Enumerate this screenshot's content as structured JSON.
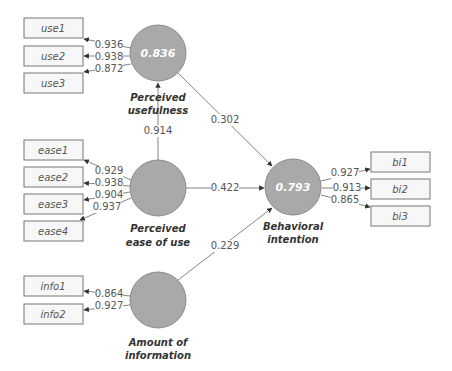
{
  "diagram": {
    "type": "structural-equation-model",
    "constructs": [
      {
        "id": "pu",
        "label_line1": "Perceived",
        "label_line2": "usefulness",
        "r2": "0.836"
      },
      {
        "id": "peou",
        "label_line1": "Perceived",
        "label_line2": "ease of use",
        "r2": ""
      },
      {
        "id": "aoi",
        "label_line1": "Amount of",
        "label_line2": "information",
        "r2": ""
      },
      {
        "id": "bi",
        "label_line1": "Behavioral",
        "label_line2": "intention",
        "r2": "0.793"
      }
    ],
    "indicators": {
      "pu": [
        {
          "label": "use1",
          "loading": "0.936"
        },
        {
          "label": "use2",
          "loading": "0.938"
        },
        {
          "label": "use3",
          "loading": "0.872"
        }
      ],
      "peou": [
        {
          "label": "ease1",
          "loading": "0.929"
        },
        {
          "label": "ease2",
          "loading": "0.938"
        },
        {
          "label": "ease3",
          "loading": "0.904"
        },
        {
          "label": "ease4",
          "loading": "0.937"
        }
      ],
      "aoi": [
        {
          "label": "info1",
          "loading": "0.864"
        },
        {
          "label": "info2",
          "loading": "0.927"
        }
      ],
      "bi": [
        {
          "label": "bi1",
          "loading": "0.927"
        },
        {
          "label": "bi2",
          "loading": "0.913"
        },
        {
          "label": "bi3",
          "loading": "0.865"
        }
      ]
    },
    "paths": [
      {
        "from": "peou",
        "to": "pu",
        "coef": "0.914"
      },
      {
        "from": "pu",
        "to": "bi",
        "coef": "0.302"
      },
      {
        "from": "peou",
        "to": "bi",
        "coef": "0.422"
      },
      {
        "from": "aoi",
        "to": "bi",
        "coef": "0.229"
      }
    ]
  }
}
